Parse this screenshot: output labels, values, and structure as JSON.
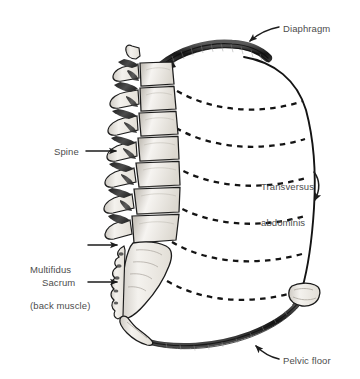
{
  "figure": {
    "background_color": "#ffffff",
    "label_color": "#4d4d4d",
    "line_color": "#1a1a1a",
    "bone_fill": "#f2f0ec",
    "muscle_fill": "#3a3a3a",
    "width": 360,
    "height": 379
  },
  "labels": {
    "diaphragm": "Diaphragm",
    "spine": "Spine",
    "transversus_line1": "Transversus",
    "transversus_line2": "abdominis",
    "multifidus_line1": "Multifidus",
    "multifidus_line2": "(back muscle)",
    "sacrum": "Sacrum",
    "pelvic_floor": "Pelvic floor"
  },
  "structures": [
    {
      "name": "diaphragm",
      "type": "muscle-band",
      "position": "top",
      "shading": "dark-hatched"
    },
    {
      "name": "spine",
      "type": "bone-column",
      "position": "left",
      "vertebrae": 6
    },
    {
      "name": "transversus-abdominis",
      "type": "dashed-fiber-lines",
      "count": 6,
      "position": "right"
    },
    {
      "name": "multifidus",
      "type": "muscle",
      "position": "posterior-spine",
      "shading": "dark"
    },
    {
      "name": "sacrum",
      "type": "bone",
      "position": "lower-left"
    },
    {
      "name": "coccyx",
      "type": "bone",
      "position": "bottom-left"
    },
    {
      "name": "pubic-bone",
      "type": "bone",
      "position": "lower-right"
    },
    {
      "name": "pelvic-floor",
      "type": "muscle-band",
      "position": "bottom",
      "shading": "dark-hatched"
    },
    {
      "name": "abdominal-wall",
      "type": "outline",
      "position": "right"
    }
  ],
  "callouts": [
    {
      "name": "diaphragm",
      "arrow": "curved",
      "direction": "down-left"
    },
    {
      "name": "spine",
      "arrow": "straight",
      "direction": "right"
    },
    {
      "name": "transversus-abdominis",
      "arrow": "curved",
      "direction": "down-right"
    },
    {
      "name": "multifidus",
      "arrow": "straight",
      "direction": "right"
    },
    {
      "name": "sacrum",
      "arrow": "straight",
      "direction": "right"
    },
    {
      "name": "pelvic-floor",
      "arrow": "curved",
      "direction": "up-left"
    }
  ]
}
